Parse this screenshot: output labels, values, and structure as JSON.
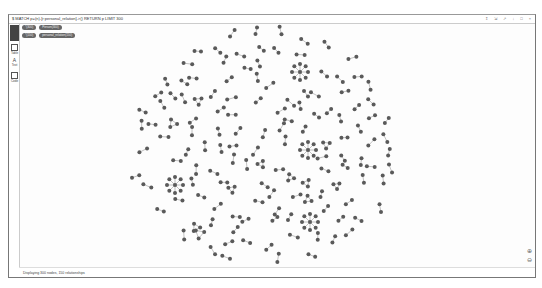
{
  "window": {
    "query": "$ MATCH p=(n)-[r:personal_relation]->() RETURN p LIMIT 300",
    "controls": [
      "↥",
      "⇲",
      "↗",
      "↓",
      "□",
      "×"
    ]
  },
  "sidebar": {
    "items": [
      {
        "label": "Graph",
        "icon": "graph-icon"
      },
      {
        "label": "Table",
        "icon": "table-icon"
      },
      {
        "label": "Text",
        "icon": "text-icon"
      },
      {
        "label": "Code",
        "icon": "code-icon"
      }
    ]
  },
  "legend": {
    "node_labels": [
      {
        "label": "*(300)"
      },
      {
        "label": "Person(300)"
      }
    ],
    "relationship_types": [
      {
        "label": "*(150)"
      },
      {
        "label": "personal_relation(150)"
      }
    ]
  },
  "footer": {
    "status": "Displaying 300 nodes, 150 relationships"
  },
  "zoom": {
    "in_icon": "zoom-in-icon",
    "out_icon": "zoom-out-icon"
  },
  "colors": {
    "node": "#5a5a5a",
    "edge": "#999999"
  }
}
